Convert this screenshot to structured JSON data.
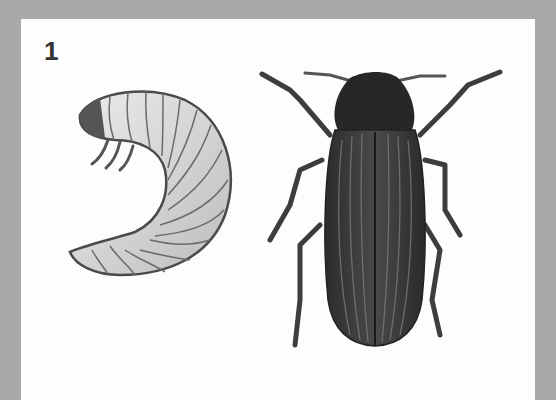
{
  "figure": {
    "number_label": "1",
    "items": [
      {
        "name": "larva",
        "description": "C-shaped segmented beetle grub (mealworm-type larva) with bristles"
      },
      {
        "name": "adult-beetle",
        "description": "Dark elongated beetle with striated elytra, six legs and antennae"
      }
    ],
    "colors": {
      "background": "#a9a9a9",
      "panel": "#fdfdfd",
      "beetle": "#3a3a3a",
      "larva": "#d6d6d6"
    }
  }
}
